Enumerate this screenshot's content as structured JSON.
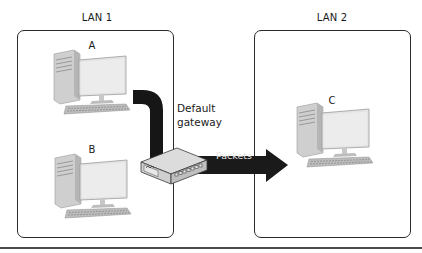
{
  "diagram": {
    "lans": [
      {
        "id": "lan1",
        "label": "LAN 1",
        "computers": [
          {
            "label": "A"
          },
          {
            "label": "B"
          }
        ]
      },
      {
        "id": "lan2",
        "label": "LAN 2",
        "computers": [
          {
            "label": "C"
          }
        ]
      }
    ],
    "gateway": {
      "label_line1": "Default",
      "label_line2": "gateway",
      "icon": "network-switch-icon"
    },
    "arrow": {
      "label": "Packets",
      "direction": "right",
      "from": "Default gateway",
      "to": "LAN 2"
    },
    "colors": {
      "box_border": "#2a2a2a",
      "arrow_fill": "#1a1a1a",
      "arrow_text": "#e8e8e8",
      "pc_body": "#d9d9d9",
      "monitor_screen": "#e4e4e4",
      "bottom_rule": "#4a4a4a"
    }
  }
}
